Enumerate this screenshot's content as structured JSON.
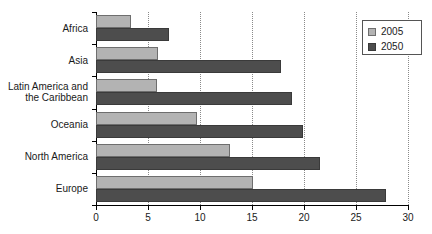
{
  "chart_data": {
    "type": "bar",
    "orientation": "horizontal",
    "title": "",
    "xlabel": "",
    "ylabel": "",
    "xlim": [
      0,
      30
    ],
    "xticks": [
      0,
      5,
      10,
      15,
      20,
      25,
      30
    ],
    "grid": true,
    "legend_position": "top-right",
    "categories": [
      "Africa",
      "Asia",
      "Latin America and\nthe Caribbean",
      "Oceania",
      "North America",
      "Europe"
    ],
    "series": [
      {
        "name": "2005",
        "color": "#b3b3b3",
        "values": [
          3.4,
          6.0,
          5.9,
          9.7,
          12.9,
          15.1
        ]
      },
      {
        "name": "2050",
        "color": "#4d4d4d",
        "values": [
          7.0,
          17.8,
          18.8,
          19.9,
          21.5,
          27.9
        ]
      }
    ]
  },
  "legend": {
    "entries": [
      {
        "label": "2005"
      },
      {
        "label": "2050"
      }
    ]
  },
  "axis": {
    "tick_labels": [
      "0",
      "5",
      "10",
      "15",
      "20",
      "25",
      "30"
    ]
  },
  "categories_display": [
    {
      "line1": "Africa",
      "line2": ""
    },
    {
      "line1": "Asia",
      "line2": ""
    },
    {
      "line1": "Latin America and",
      "line2": "the Caribbean"
    },
    {
      "line1": "Oceania",
      "line2": ""
    },
    {
      "line1": "North America",
      "line2": ""
    },
    {
      "line1": "Europe",
      "line2": ""
    }
  ]
}
